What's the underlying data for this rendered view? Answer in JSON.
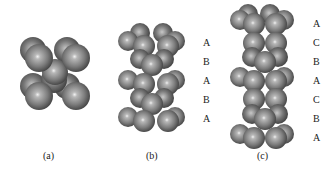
{
  "figure": {
    "panels": [
      {
        "id": "a",
        "caption": "(a)",
        "layers": []
      },
      {
        "id": "b",
        "caption": "(b)",
        "layers": [
          "A",
          "B",
          "A",
          "B",
          "A"
        ]
      },
      {
        "id": "c",
        "caption": "(c)",
        "layers": [
          "A",
          "C",
          "B",
          "A",
          "C",
          "B",
          "A"
        ]
      }
    ]
  },
  "colors": {
    "sphere": "#7a7a7a",
    "sphere_highlight": "#e8e8e8",
    "sphere_shadow": "#3a3a3a"
  }
}
